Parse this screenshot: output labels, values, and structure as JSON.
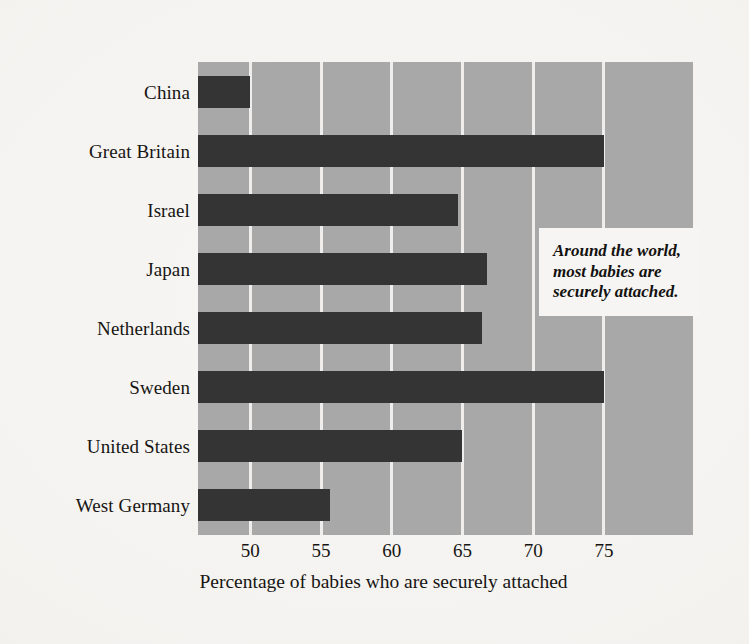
{
  "chart_data": {
    "type": "bar",
    "orientation": "horizontal",
    "title": "",
    "xlabel": "Percentage of babies who are securely attached",
    "ylabel": "",
    "categories": [
      "China",
      "Great Britain",
      "Israel",
      "Japan",
      "Netherlands",
      "Sweden",
      "United States",
      "West Germany"
    ],
    "values": [
      50.0,
      75.0,
      64.7,
      66.7,
      66.4,
      75.0,
      65.0,
      55.6
    ],
    "xlim": [
      46.3,
      81.3
    ],
    "xticks": [
      50,
      55,
      60,
      65,
      70,
      75
    ],
    "xticklabels": [
      "50",
      "55",
      "60",
      "65",
      "70",
      "75"
    ],
    "grid": "vertical-only",
    "legend": "none",
    "annotations": [
      {
        "text": "Around the world, most babies are securely attached.",
        "style": "bold-italic",
        "position": "upper-right-inside-plot"
      }
    ],
    "colors": {
      "bar": "#343434",
      "plot_background": "#a8a8a8",
      "gridline": "#efeeec",
      "page_background": "#f3f2ef",
      "annotation_background": "#f6f5f3",
      "text": "#171513"
    }
  }
}
